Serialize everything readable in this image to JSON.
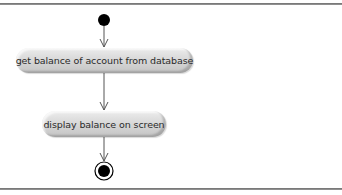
{
  "diagram": {
    "type": "UML activity diagram",
    "nodes": [
      {
        "id": "start",
        "kind": "initial-node"
      },
      {
        "id": "a1",
        "kind": "action",
        "label": "get balance of account from database"
      },
      {
        "id": "a2",
        "kind": "action",
        "label": "display balance on screen"
      },
      {
        "id": "end",
        "kind": "final-node"
      }
    ],
    "edges": [
      {
        "from": "start",
        "to": "a1"
      },
      {
        "from": "a1",
        "to": "a2"
      },
      {
        "from": "a2",
        "to": "end"
      }
    ]
  },
  "labels": {
    "activity_1": "get balance of account from database",
    "activity_2": "display balance on screen"
  },
  "colors": {
    "node_fill": "#000000",
    "edge": "#555555",
    "activity_fill": "#d9d9d9",
    "frame_line": "#7a7a7a"
  }
}
